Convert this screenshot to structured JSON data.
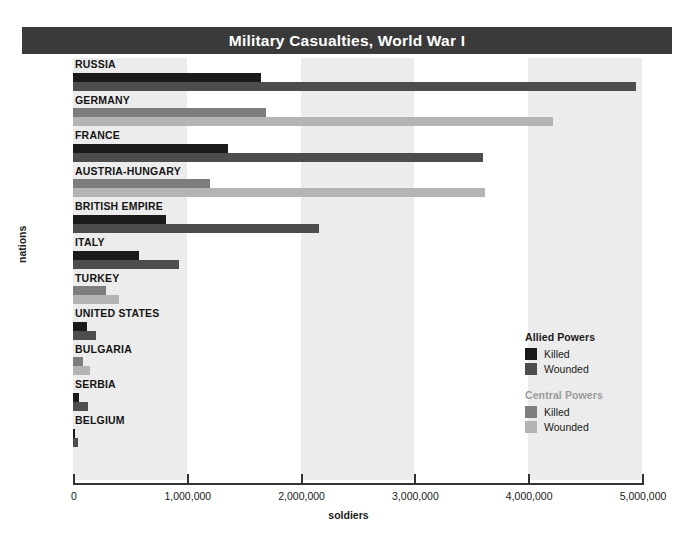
{
  "title": "Military Casualties, World War I",
  "axes": {
    "xlabel": "soldiers",
    "ylabel": "nations",
    "xticks": [
      "0",
      "1,000,000",
      "2,000,000",
      "3,000,000",
      "4,000,000",
      "5,000,000"
    ]
  },
  "legend": {
    "allied": {
      "heading": "Allied Powers",
      "killed_label": "Killed",
      "wounded_label": "Wounded",
      "killed_color": "#1a1a1a",
      "wounded_color": "#4d4d4d"
    },
    "central": {
      "heading": "Central Powers",
      "killed_label": "Killed",
      "wounded_label": "Wounded",
      "killed_color": "#7d7d7d",
      "wounded_color": "#b4b4b4"
    }
  },
  "chart_data": {
    "type": "bar",
    "orientation": "horizontal",
    "title": "Military Casualties, World War I",
    "xlabel": "soldiers",
    "ylabel": "nations",
    "xlim": [
      0,
      5000000
    ],
    "xticks": [
      0,
      1000000,
      2000000,
      3000000,
      4000000,
      5000000
    ],
    "grid": false,
    "legend_position": "inside-right",
    "categories": [
      "RUSSIA",
      "GERMANY",
      "FRANCE",
      "AUSTRIA-HUNGARY",
      "BRITISH EMPIRE",
      "ITALY",
      "TURKEY",
      "UNITED STATES",
      "BULGARIA",
      "SERBIA",
      "BELGIUM"
    ],
    "series": [
      {
        "name": "Killed",
        "values": [
          1650000,
          1700000,
          1360000,
          1200000,
          820000,
          580000,
          290000,
          120000,
          90000,
          50000,
          15000
        ]
      },
      {
        "name": "Wounded",
        "values": [
          4950000,
          4220000,
          3600000,
          3620000,
          2160000,
          930000,
          400000,
          200000,
          150000,
          130000,
          45000
        ]
      }
    ],
    "rows": [
      {
        "nation": "RUSSIA",
        "alliance": "allied",
        "killed": 1650000,
        "wounded": 4950000
      },
      {
        "nation": "GERMANY",
        "alliance": "central",
        "killed": 1700000,
        "wounded": 4220000
      },
      {
        "nation": "FRANCE",
        "alliance": "allied",
        "killed": 1360000,
        "wounded": 3600000
      },
      {
        "nation": "AUSTRIA-HUNGARY",
        "alliance": "central",
        "killed": 1200000,
        "wounded": 3620000
      },
      {
        "nation": "BRITISH EMPIRE",
        "alliance": "allied",
        "killed": 820000,
        "wounded": 2160000
      },
      {
        "nation": "ITALY",
        "alliance": "allied",
        "killed": 580000,
        "wounded": 930000
      },
      {
        "nation": "TURKEY",
        "alliance": "central",
        "killed": 290000,
        "wounded": 400000
      },
      {
        "nation": "UNITED STATES",
        "alliance": "allied",
        "killed": 120000,
        "wounded": 200000
      },
      {
        "nation": "BULGARIA",
        "alliance": "central",
        "killed": 90000,
        "wounded": 150000
      },
      {
        "nation": "SERBIA",
        "alliance": "allied",
        "killed": 50000,
        "wounded": 130000
      },
      {
        "nation": "BELGIUM",
        "alliance": "allied",
        "killed": 15000,
        "wounded": 45000
      }
    ]
  }
}
